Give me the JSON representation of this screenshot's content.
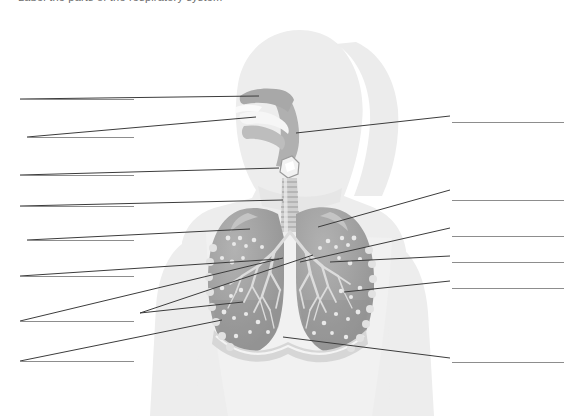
{
  "page": {
    "width": 584,
    "height": 416,
    "background": "#ffffff",
    "title": "Label the parts of the respiratory system",
    "title_clipped": true
  },
  "diagram": {
    "name": "respiratory-system-diagram",
    "colors": {
      "body_silhouette": "#ededed",
      "body_silhouette_shadow": "#e3e3e3",
      "airway_dark": "#b5b5b5",
      "lung_fill": "#9b9b9b",
      "lung_shadow": "#8a8a8a",
      "trachea_ring": "#c9c9c9",
      "bronchi": "#d9d9d9",
      "leader_line": "#3c3c3c",
      "blank_line": "#8d8d8d"
    },
    "structures": [
      {
        "name": "nasal-cavity",
        "x": 258,
        "y": 98
      },
      {
        "name": "oral-cavity",
        "x": 248,
        "y": 120
      },
      {
        "name": "pharynx",
        "x": 296,
        "y": 133
      },
      {
        "name": "larynx",
        "x": 287,
        "y": 167
      },
      {
        "name": "trachea",
        "x": 290,
        "y": 203
      },
      {
        "name": "right-lung",
        "x": 253,
        "y": 235
      },
      {
        "name": "left-lung",
        "x": 332,
        "y": 225
      },
      {
        "name": "primary-bronchus",
        "x": 292,
        "y": 263
      },
      {
        "name": "bronchiole",
        "x": 342,
        "y": 272
      },
      {
        "name": "alveoli",
        "x": 240,
        "y": 303
      },
      {
        "name": "pleura",
        "x": 224,
        "y": 325
      },
      {
        "name": "diaphragm",
        "x": 283,
        "y": 337
      }
    ]
  },
  "answer_blanks": {
    "left": [
      {
        "id": "blank-left-1",
        "label": "",
        "x": 20,
        "y": 99,
        "width": 114
      },
      {
        "id": "blank-left-2",
        "label": "",
        "x": 27,
        "y": 137,
        "width": 107
      },
      {
        "id": "blank-left-3",
        "label": "",
        "x": 20,
        "y": 175,
        "width": 114
      },
      {
        "id": "blank-left-4",
        "label": "",
        "x": 20,
        "y": 206,
        "width": 114
      },
      {
        "id": "blank-left-5",
        "label": "",
        "x": 27,
        "y": 240,
        "width": 107
      },
      {
        "id": "blank-left-6",
        "label": "",
        "x": 20,
        "y": 276,
        "width": 114
      },
      {
        "id": "blank-left-7",
        "label": "",
        "x": 20,
        "y": 321,
        "width": 114
      },
      {
        "id": "blank-left-8",
        "label": "",
        "x": 20,
        "y": 361,
        "width": 114
      }
    ],
    "right": [
      {
        "id": "blank-right-1",
        "label": "",
        "x": 452,
        "y": 122,
        "width": 112
      },
      {
        "id": "blank-right-2",
        "label": "",
        "x": 452,
        "y": 200,
        "width": 112
      },
      {
        "id": "blank-right-3",
        "label": "",
        "x": 452,
        "y": 236,
        "width": 112
      },
      {
        "id": "blank-right-4",
        "label": "",
        "x": 452,
        "y": 262,
        "width": 112
      },
      {
        "id": "blank-right-5",
        "label": "",
        "x": 452,
        "y": 288,
        "width": 112
      },
      {
        "id": "blank-right-6",
        "label": "",
        "x": 452,
        "y": 362,
        "width": 112
      }
    ]
  },
  "leader_lines": {
    "left": [
      {
        "id": "leader-left-1",
        "from_x": 20,
        "from_y": 99,
        "to_x": 259,
        "to_y": 96
      },
      {
        "id": "leader-left-2",
        "from_x": 27,
        "from_y": 137,
        "to_x": 256,
        "to_y": 117
      },
      {
        "id": "leader-left-3",
        "from_x": 20,
        "from_y": 175,
        "to_x": 279,
        "to_y": 168
      },
      {
        "id": "leader-left-4",
        "from_x": 20,
        "from_y": 206,
        "to_x": 283,
        "to_y": 200
      },
      {
        "id": "leader-left-5",
        "from_x": 27,
        "from_y": 240,
        "to_x": 250,
        "to_y": 229
      },
      {
        "id": "leader-left-6",
        "from_x": 20,
        "from_y": 276,
        "to_x": 279,
        "to_y": 259
      },
      {
        "id": "leader-left-7",
        "from_x": 140,
        "from_y": 313,
        "to_x": 313,
        "to_y": 255
      },
      {
        "id": "leader-left-8",
        "from_x": 140,
        "from_y": 313,
        "to_x": 243,
        "to_y": 302
      },
      {
        "id": "leader-left-9",
        "from_x": 20,
        "from_y": 321,
        "to_x": 283,
        "to_y": 258
      },
      {
        "id": "leader-left-10",
        "from_x": 20,
        "from_y": 361,
        "to_x": 222,
        "to_y": 320
      }
    ],
    "right": [
      {
        "id": "leader-right-1",
        "from_x": 450,
        "from_y": 116,
        "to_x": 296,
        "to_y": 133
      },
      {
        "id": "leader-right-2",
        "from_x": 450,
        "from_y": 190,
        "to_x": 318,
        "to_y": 227
      },
      {
        "id": "leader-right-3",
        "from_x": 450,
        "from_y": 228,
        "to_x": 300,
        "to_y": 262
      },
      {
        "id": "leader-right-4",
        "from_x": 450,
        "from_y": 256,
        "to_x": 330,
        "to_y": 262
      },
      {
        "id": "leader-right-5",
        "from_x": 450,
        "from_y": 281,
        "to_x": 344,
        "to_y": 292
      },
      {
        "id": "leader-right-6",
        "from_x": 450,
        "from_y": 358,
        "to_x": 283,
        "to_y": 337
      }
    ]
  }
}
